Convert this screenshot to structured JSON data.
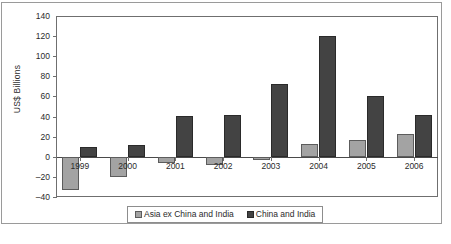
{
  "chart_data": {
    "type": "bar",
    "title": "",
    "xlabel": "",
    "ylabel": "US$ Billions",
    "ylim": [
      -40,
      140
    ],
    "ytick_step": 20,
    "yticks": [
      "140",
      "120",
      "100",
      "80",
      "60",
      "40",
      "20",
      "0",
      "-20",
      "-40"
    ],
    "grid": false,
    "legend_position": "bottom-center",
    "categories": [
      "1999",
      "2000",
      "2001",
      "2002",
      "2003",
      "2004",
      "2005",
      "2006"
    ],
    "series": [
      {
        "name": "Asia ex China and India",
        "color": "#a3a3a3",
        "values": [
          -33,
          -20,
          -6,
          -8,
          -3,
          13,
          17,
          23
        ]
      },
      {
        "name": "China and India",
        "color": "#434343",
        "values": [
          10,
          12,
          41,
          42,
          72,
          120,
          60,
          42
        ]
      }
    ]
  },
  "legend": {
    "items": [
      {
        "label": "Asia ex China and India",
        "swatch": "light-gray-square"
      },
      {
        "label": "China and India",
        "swatch": "dark-gray-square"
      }
    ]
  },
  "caption_fragment": ""
}
